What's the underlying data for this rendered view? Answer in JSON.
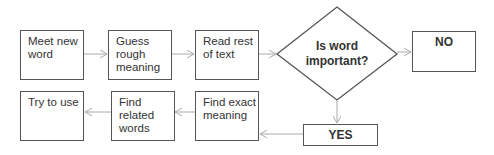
{
  "flowchart": {
    "nodes": {
      "meet": {
        "label": "Meet new word"
      },
      "guess": {
        "label": "Guess rough meaning"
      },
      "read": {
        "label": "Read rest of text"
      },
      "decision": {
        "label": "Is word important?"
      },
      "no": {
        "label": "NO"
      },
      "yes": {
        "label": "YES"
      },
      "exact": {
        "label": "Find exact meaning"
      },
      "related": {
        "label": "Find related words"
      },
      "use": {
        "label": "Try to use"
      }
    },
    "edges": [
      {
        "from": "meet",
        "to": "guess"
      },
      {
        "from": "guess",
        "to": "read"
      },
      {
        "from": "read",
        "to": "decision"
      },
      {
        "from": "decision",
        "to": "no"
      },
      {
        "from": "decision",
        "to": "yes"
      },
      {
        "from": "yes",
        "to": "exact"
      },
      {
        "from": "exact",
        "to": "related"
      },
      {
        "from": "related",
        "to": "use"
      }
    ],
    "colors": {
      "border": "#555555",
      "arrow": "#aaaaaa",
      "text": "#333333"
    }
  }
}
